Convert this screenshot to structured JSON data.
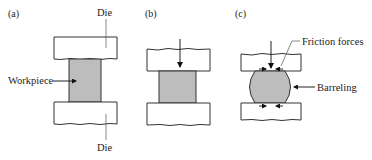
{
  "figure": {
    "panels": [
      {
        "id": "a",
        "label": "(a)",
        "annotations": {
          "top_die": "Die",
          "workpiece": "Workpiece",
          "bottom_die": "Die"
        }
      },
      {
        "id": "b",
        "label": "(b)",
        "annotations": {}
      },
      {
        "id": "c",
        "label": "(c)",
        "annotations": {
          "friction": "Friction forces",
          "barreling": "Barreling"
        }
      }
    ],
    "colors": {
      "workpiece_fill": "#bdbdbd",
      "die_fill": "#ffffff",
      "outline": "#333333"
    }
  }
}
